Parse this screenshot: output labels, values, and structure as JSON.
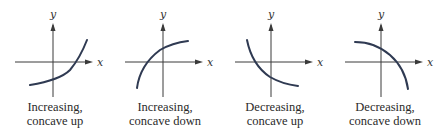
{
  "colors": {
    "curve": "#2f3a52",
    "axis": "#3a3a3a",
    "text": "#2a2a2a"
  },
  "axes": {
    "x_label": "x",
    "y_label": "y"
  },
  "panels": [
    {
      "id": "inc-up",
      "caption_line1": "Increasing,",
      "caption_line2": "concave up",
      "curve_path": "M 30 85 Q 60 80 70 70 Q 80 58 87 40"
    },
    {
      "id": "inc-down",
      "caption_line1": "Increasing,",
      "caption_line2": "concave down",
      "curve_path": "M 27 88 Q 30 65 50 50 Q 62 43 78 41"
    },
    {
      "id": "dec-up",
      "caption_line1": "Decreasing,",
      "caption_line2": "concave up",
      "curve_path": "M 27 40 Q 32 65 50 77 Q 62 84 78 86"
    },
    {
      "id": "dec-down",
      "caption_line1": "Decreasing,",
      "caption_line2": "concave down",
      "curve_path": "M 25 42 Q 45 42 60 55 Q 75 68 78 89"
    }
  ]
}
